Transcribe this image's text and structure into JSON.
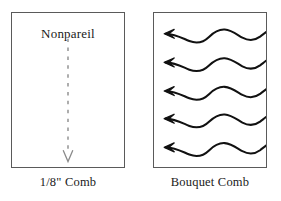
{
  "figure": {
    "background_color": "#ffffff",
    "ink_color": "#1a1a1a",
    "border_color": "#5a5a5a",
    "dashed_line_color": "#8a8a8a"
  },
  "panels": [
    {
      "id": "nonpareil-panel",
      "inside_label": "Nonpareil",
      "caption": "1/8\" Comb",
      "marker_type": "dashed-vertical-arrow",
      "marker_direction": "down",
      "marker_count": 1
    },
    {
      "id": "bouquet-panel",
      "inside_label": "",
      "caption": "Bouquet Comb",
      "marker_type": "wavy-arrow",
      "marker_direction": "left",
      "marker_count": 5
    }
  ],
  "left_panel": {
    "label": "Nonpareil",
    "caption": "1/8\" Comb"
  },
  "right_panel": {
    "label": "",
    "caption": "Bouquet Comb"
  }
}
